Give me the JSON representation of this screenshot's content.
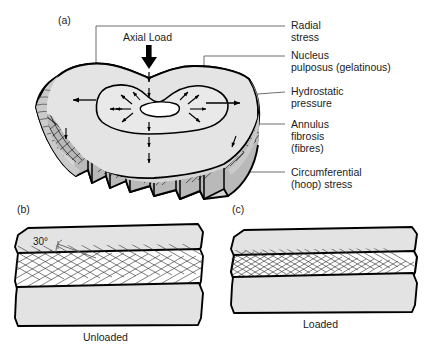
{
  "figure": {
    "background_color": "#ffffff",
    "line_color": "#000000",
    "leader_color": "#5e5e5e",
    "fill_light": "#e2e2e2",
    "fill_mid": "#c9c9c9",
    "fill_white": "#ffffff"
  },
  "panels": {
    "a": {
      "letter": "(a)",
      "axial_load_label": "Axial Load",
      "labels": [
        {
          "id": "radial-stress",
          "line1": "Radial",
          "line2": "stress",
          "line3": ""
        },
        {
          "id": "nucleus-pulposus",
          "line1": "Nucleus",
          "line2": "pulposus (gelatinous)",
          "line3": ""
        },
        {
          "id": "hydrostatic-pressure",
          "line1": "Hydrostatic",
          "line2": "pressure",
          "line3": ""
        },
        {
          "id": "annulus-fibrosis",
          "line1": "Annulus",
          "line2": "fibrosis",
          "line3": "(fibres)"
        },
        {
          "id": "circumferential-hoop-stress",
          "line1": "Circumferential",
          "line2": "(hoop) stress",
          "line3": ""
        }
      ]
    },
    "b": {
      "letter": "(b)",
      "caption": "Unloaded",
      "angle_label": "30°"
    },
    "c": {
      "letter": "(c)",
      "caption": "Loaded"
    }
  }
}
